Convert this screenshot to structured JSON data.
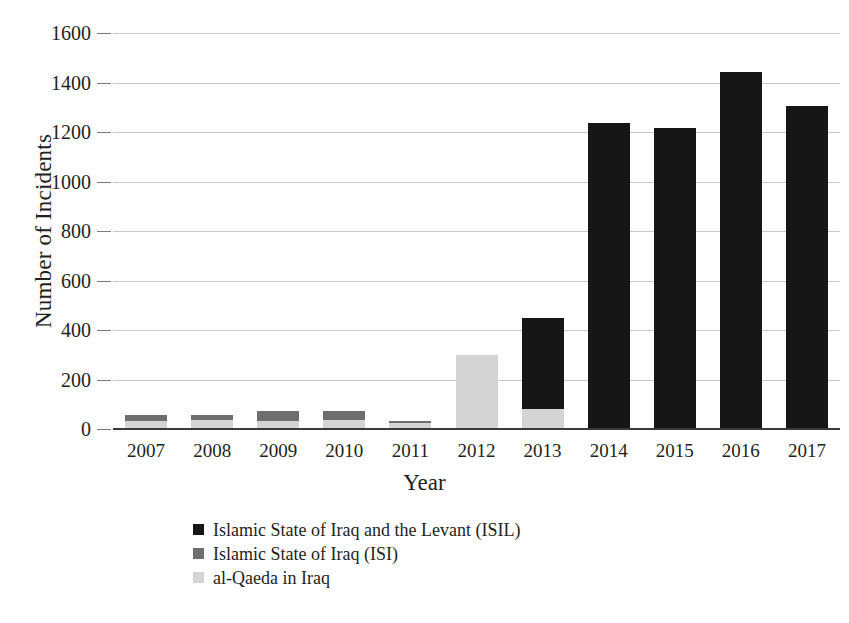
{
  "chart_data": {
    "type": "bar",
    "subtype": "stacked-bar",
    "title": "",
    "xlabel": "Year",
    "ylabel": "Number of Incidents",
    "categories": [
      "2007",
      "2008",
      "2009",
      "2010",
      "2011",
      "2012",
      "2013",
      "2014",
      "2015",
      "2016",
      "2017"
    ],
    "ylim": [
      0,
      1600
    ],
    "ytick_labels": [
      "0",
      "200",
      "400",
      "600",
      "800",
      "1000",
      "1200",
      "1400",
      "1600"
    ],
    "ytick_values": [
      0,
      200,
      400,
      600,
      800,
      1000,
      1200,
      1400,
      1600
    ],
    "grid": true,
    "legend_position": "bottom-left",
    "series": [
      {
        "name": "Islamic State of Iraq and the Levant (ISIL)",
        "short": "ISIL",
        "color": "#161616",
        "values": [
          0,
          0,
          0,
          0,
          0,
          0,
          370,
          1237,
          1215,
          1443,
          1307
        ]
      },
      {
        "name": "Islamic State of Iraq (ISI)",
        "short": "ISI",
        "color": "#6e6e6e",
        "values": [
          22,
          20,
          40,
          36,
          8,
          0,
          0,
          0,
          0,
          0,
          0
        ]
      },
      {
        "name": "al-Qaeda in Iraq",
        "short": "AQI",
        "color": "#d4d4d4",
        "values": [
          33,
          35,
          32,
          38,
          26,
          300,
          80,
          0,
          0,
          0,
          0
        ]
      }
    ],
    "totals": [
      55,
      55,
      72,
      74,
      34,
      300,
      450,
      1237,
      1215,
      1443,
      1307
    ]
  },
  "axes": {
    "y_title": "Number of Incidents",
    "x_title": "Year"
  },
  "legend": {
    "items": [
      {
        "label": "Islamic State of Iraq and the Levant (ISIL)",
        "color": "#161616"
      },
      {
        "label": "Islamic State of Iraq (ISI)",
        "color": "#6e6e6e"
      },
      {
        "label": "al-Qaeda in Iraq",
        "color": "#d4d4d4"
      }
    ]
  }
}
